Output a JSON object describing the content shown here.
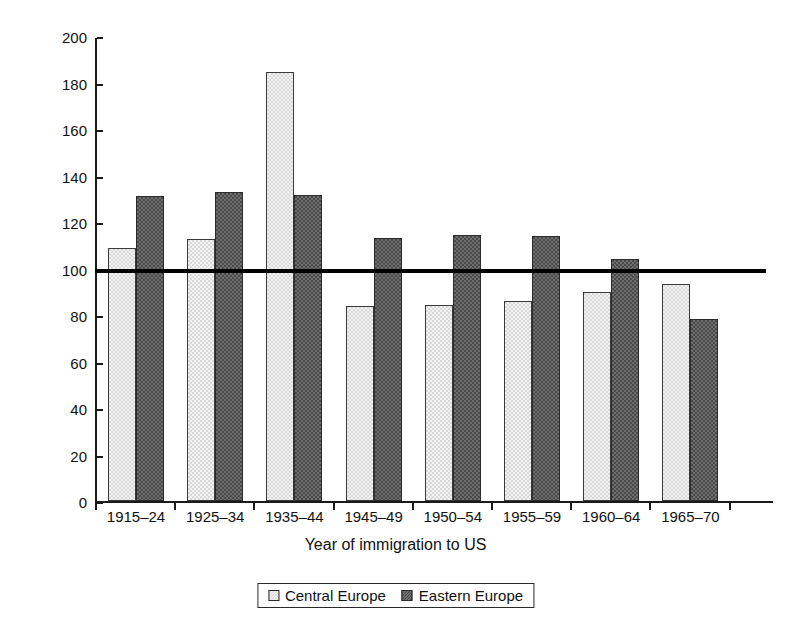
{
  "chart_data": {
    "type": "bar",
    "title": "",
    "xlabel": "Year of immigration to US",
    "ylabel": "Percent",
    "categories": [
      "1915–24",
      "1925–34",
      "1935–44",
      "1945–49",
      "1950–54",
      "1955–59",
      "1960–64",
      "1965–70"
    ],
    "series": [
      {
        "name": "Central Europe",
        "values": [
          109,
          112.5,
          184.5,
          84,
          84.5,
          86,
          90,
          93.5
        ],
        "color": "#d9d9d9"
      },
      {
        "name": "Eastern Europe",
        "values": [
          131,
          133,
          131.5,
          113,
          114.5,
          114,
          104,
          78.5
        ],
        "color": "#4a4a4a"
      }
    ],
    "ylim": [
      0,
      200
    ],
    "yticks": [
      0,
      20,
      40,
      60,
      80,
      100,
      120,
      140,
      160,
      180,
      200
    ],
    "ytick_labels": [
      "0",
      "20",
      "40",
      "60",
      "80",
      "100",
      "120",
      "140",
      "160",
      "180",
      "200"
    ],
    "grid": false,
    "legend_position": "bottom",
    "reference_line": {
      "value": 100,
      "label": "",
      "color": "#000000"
    }
  },
  "legend": {
    "items": [
      {
        "label": "Central Europe",
        "swatch": "central-europe-swatch"
      },
      {
        "label": "Eastern Europe",
        "swatch": "eastern-europe-swatch"
      }
    ]
  },
  "axes": {
    "x_title": "Year of immigration to US",
    "y_title": "Percent"
  }
}
